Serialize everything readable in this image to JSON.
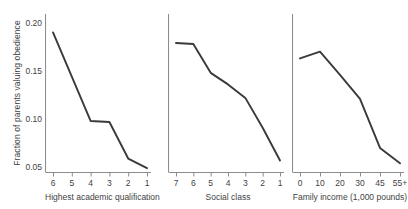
{
  "chart_data": {
    "type": "line",
    "title": "",
    "ylabel": "Fraction of parents valuing obedience",
    "ylim": [
      0.045,
      0.205
    ],
    "yticks": [
      0.05,
      0.1,
      0.15,
      0.2
    ],
    "yticklabels": [
      "0.05",
      "0.10",
      "0.15",
      "0.20"
    ],
    "grid": false,
    "legend": "none",
    "line_color": "#3a3a3a",
    "axis_color": "#8c8c8c",
    "panels": [
      {
        "xlabel": "Highest academic qualification",
        "categories": [
          "6",
          "5",
          "4",
          "3",
          "2",
          "1"
        ],
        "values": [
          0.19,
          0.144,
          0.098,
          0.097,
          0.059,
          0.049
        ]
      },
      {
        "xlabel": "Social class",
        "categories": [
          "7",
          "6",
          "5",
          "4",
          "3",
          "2",
          "1"
        ],
        "values": [
          0.179,
          0.178,
          0.148,
          0.136,
          0.122,
          0.091,
          0.057
        ]
      },
      {
        "xlabel": "Family income (1,000 pounds)",
        "categories": [
          "0",
          "10",
          "20",
          "30",
          "45",
          "55+"
        ],
        "values": [
          0.163,
          0.17,
          0.146,
          0.121,
          0.07,
          0.054
        ]
      }
    ]
  }
}
